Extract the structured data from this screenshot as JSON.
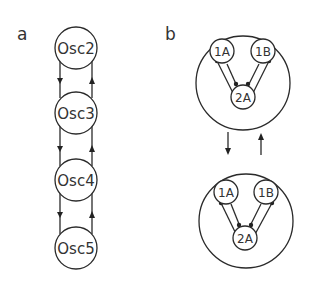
{
  "panels": {
    "a": {
      "label": "a",
      "nodes": [
        {
          "id": "osc2",
          "label": "Osc2"
        },
        {
          "id": "osc3",
          "label": "Osc3"
        },
        {
          "id": "osc4",
          "label": "Osc4"
        },
        {
          "id": "osc5",
          "label": "Osc5"
        }
      ],
      "edges": [
        {
          "from": "osc2",
          "to": "osc3",
          "direction": "down"
        },
        {
          "from": "osc3",
          "to": "osc2",
          "direction": "up"
        },
        {
          "from": "osc3",
          "to": "osc4",
          "direction": "down"
        },
        {
          "from": "osc4",
          "to": "osc3",
          "direction": "up"
        },
        {
          "from": "osc4",
          "to": "osc5",
          "direction": "down"
        },
        {
          "from": "osc5",
          "to": "osc4",
          "direction": "up"
        }
      ]
    },
    "b": {
      "label": "b",
      "modules": [
        {
          "id": "top",
          "nodes": [
            {
              "id": "1A",
              "label": "1A"
            },
            {
              "id": "1B",
              "label": "1B"
            },
            {
              "id": "2A",
              "label": "2A"
            }
          ]
        },
        {
          "id": "bottom",
          "nodes": [
            {
              "id": "1A",
              "label": "1A"
            },
            {
              "id": "1B",
              "label": "1B"
            },
            {
              "id": "2A",
              "label": "2A"
            }
          ]
        }
      ],
      "edges": [
        {
          "from": "top",
          "to": "bottom",
          "direction": "down"
        },
        {
          "from": "bottom",
          "to": "top",
          "direction": "up"
        }
      ]
    }
  }
}
